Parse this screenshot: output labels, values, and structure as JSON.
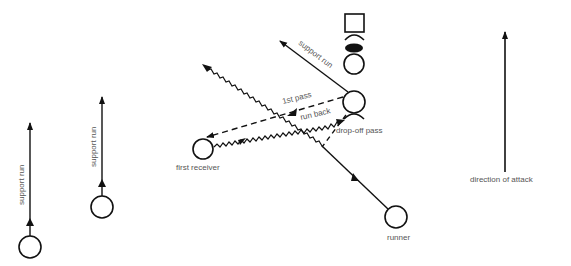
{
  "diagram": {
    "labels": {
      "support_run_top": "support  run",
      "support_run_left": "support  run",
      "support_run_mid": "support  run",
      "first_pass": "1st pass",
      "run_back": "run back",
      "drop_off_pass": "drop-off pass",
      "first_receiver": "first receiver",
      "runner": "runner",
      "direction_of_attack": "direction of attack"
    },
    "colors": {
      "line": "#111111",
      "text": "#555555"
    }
  }
}
